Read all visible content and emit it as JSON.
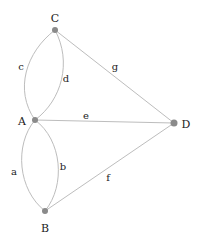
{
  "diagram": {
    "type": "graph",
    "colors": {
      "edge": "#bdbdbd",
      "node": "#8a8a8a",
      "text": "#222222",
      "background": "#ffffff"
    },
    "nodes": [
      {
        "id": "C",
        "label": "C",
        "x": 55,
        "y": 30,
        "lx": 55,
        "ly": 22,
        "anchor": "middle"
      },
      {
        "id": "A",
        "label": "A",
        "x": 35,
        "y": 120,
        "lx": 22,
        "ly": 125,
        "anchor": "middle"
      },
      {
        "id": "D",
        "label": "D",
        "x": 174,
        "y": 123,
        "lx": 186,
        "ly": 128,
        "anchor": "middle"
      },
      {
        "id": "B",
        "label": "B",
        "x": 45,
        "y": 211,
        "lx": 45,
        "ly": 232,
        "anchor": "middle"
      }
    ],
    "edges": [
      {
        "id": "c",
        "label": "c",
        "from": "A",
        "to": "C",
        "lx": 21,
        "ly": 70
      },
      {
        "id": "d",
        "label": "d",
        "from": "A",
        "to": "C",
        "lx": 66,
        "ly": 82
      },
      {
        "id": "g",
        "label": "g",
        "from": "C",
        "to": "D",
        "lx": 115,
        "ly": 70
      },
      {
        "id": "e",
        "label": "e",
        "from": "A",
        "to": "D",
        "lx": 86,
        "ly": 119
      },
      {
        "id": "a",
        "label": "a",
        "from": "A",
        "to": "B",
        "lx": 14,
        "ly": 175
      },
      {
        "id": "b",
        "label": "b",
        "from": "A",
        "to": "B",
        "lx": 63,
        "ly": 170
      },
      {
        "id": "f",
        "label": "f",
        "from": "B",
        "to": "D",
        "lx": 108,
        "ly": 181
      }
    ]
  }
}
